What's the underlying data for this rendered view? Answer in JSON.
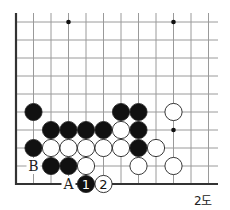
{
  "diagram": {
    "caption": "2도",
    "grid": {
      "origin_x": 16,
      "origin_y": 22,
      "col_spacing": 17.5,
      "row_spacing": 18,
      "cols": 12,
      "rows": 10,
      "line_color": "#9a9a9a",
      "edge_color": "#333333",
      "right_extend": 218,
      "top_extend": 13
    },
    "star_points": [
      {
        "col": 3,
        "row": 0
      },
      {
        "col": 9,
        "row": 0
      },
      {
        "col": 9,
        "row": 6
      }
    ],
    "stones": [
      {
        "col": 1,
        "row": 5,
        "color": "black"
      },
      {
        "col": 6,
        "row": 5,
        "color": "black"
      },
      {
        "col": 7,
        "row": 5,
        "color": "black"
      },
      {
        "col": 9,
        "row": 5,
        "color": "white"
      },
      {
        "col": 2,
        "row": 6,
        "color": "black"
      },
      {
        "col": 3,
        "row": 6,
        "color": "black"
      },
      {
        "col": 4,
        "row": 6,
        "color": "black"
      },
      {
        "col": 5,
        "row": 6,
        "color": "black"
      },
      {
        "col": 6,
        "row": 6,
        "color": "white"
      },
      {
        "col": 7,
        "row": 6,
        "color": "black"
      },
      {
        "col": 1,
        "row": 7,
        "color": "black"
      },
      {
        "col": 2,
        "row": 7,
        "color": "white"
      },
      {
        "col": 3,
        "row": 7,
        "color": "white"
      },
      {
        "col": 4,
        "row": 7,
        "color": "white"
      },
      {
        "col": 5,
        "row": 7,
        "color": "white"
      },
      {
        "col": 6,
        "row": 7,
        "color": "white"
      },
      {
        "col": 7,
        "row": 7,
        "color": "black"
      },
      {
        "col": 8,
        "row": 7,
        "color": "white"
      },
      {
        "col": 2,
        "row": 8,
        "color": "black"
      },
      {
        "col": 3,
        "row": 8,
        "color": "black"
      },
      {
        "col": 4,
        "row": 8,
        "color": "white"
      },
      {
        "col": 7,
        "row": 8,
        "color": "white"
      },
      {
        "col": 9,
        "row": 8,
        "color": "white"
      },
      {
        "col": 4,
        "row": 9,
        "color": "black",
        "label": "1"
      },
      {
        "col": 5,
        "row": 9,
        "color": "white",
        "label": "2"
      }
    ],
    "letter_labels": [
      {
        "col": 1,
        "row": 8,
        "text": "B"
      },
      {
        "col": 3,
        "row": 9,
        "text": "A"
      }
    ],
    "colors": {
      "black_stone": "#111111",
      "white_stone": "#ffffff",
      "stone_outline": "#222222",
      "background": "#ffffff"
    }
  }
}
